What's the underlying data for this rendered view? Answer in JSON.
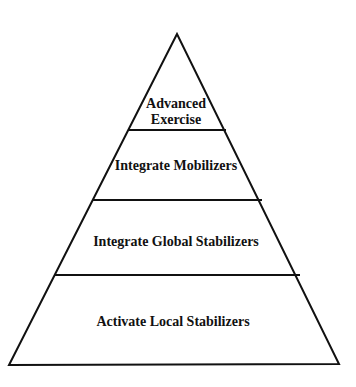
{
  "diagram": {
    "type": "pyramid",
    "levels": [
      {
        "label_lines": [
          "Advanced",
          "Exercise"
        ]
      },
      {
        "label_lines": [
          "Integrate Mobilizers"
        ]
      },
      {
        "label_lines": [
          "Integrate Global Stabilizers"
        ]
      },
      {
        "label_lines": [
          "Activate Local Stabilizers"
        ]
      }
    ],
    "colors": {
      "stroke": "#111111",
      "fill": "#ffffff",
      "text": "#111111"
    }
  }
}
